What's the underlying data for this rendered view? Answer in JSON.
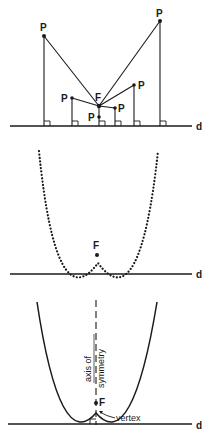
{
  "panel1": {
    "directrix_label": "d",
    "focus_label": "F",
    "point_label": "P"
  },
  "panel2": {
    "directrix_label": "d",
    "focus_label": "F"
  },
  "panel3": {
    "directrix_label": "d",
    "focus_label": "F",
    "axis_label_line1": "axis of",
    "axis_label_line2": "symmetry",
    "vertex_label": "vertex"
  }
}
